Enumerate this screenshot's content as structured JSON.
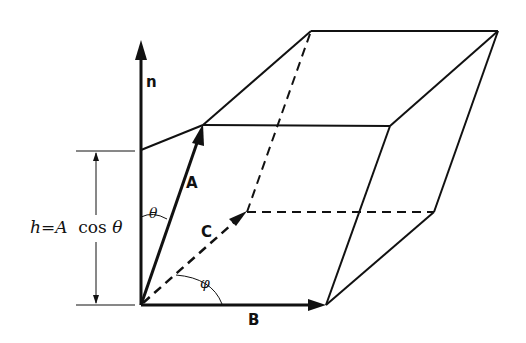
{
  "figure": {
    "colors": {
      "ink": "#111111",
      "background": "#ffffff"
    },
    "vectors": {
      "n": {
        "label": "n",
        "style": "bold arrow, vertical"
      },
      "A": {
        "label": "A",
        "style": "bold arrow, solid"
      },
      "B": {
        "label": "B",
        "style": "bold arrow, horizontal solid"
      },
      "C": {
        "label": "C",
        "style": "arrow, dashed"
      }
    },
    "angles": {
      "theta": {
        "symbol": "θ",
        "between": "n and A"
      },
      "phi": {
        "symbol": "φ",
        "between": "B and C"
      }
    },
    "height_label": {
      "h": "h",
      "eq": "=",
      "A": "A",
      "cos": "cos",
      "theta": "θ"
    }
  }
}
